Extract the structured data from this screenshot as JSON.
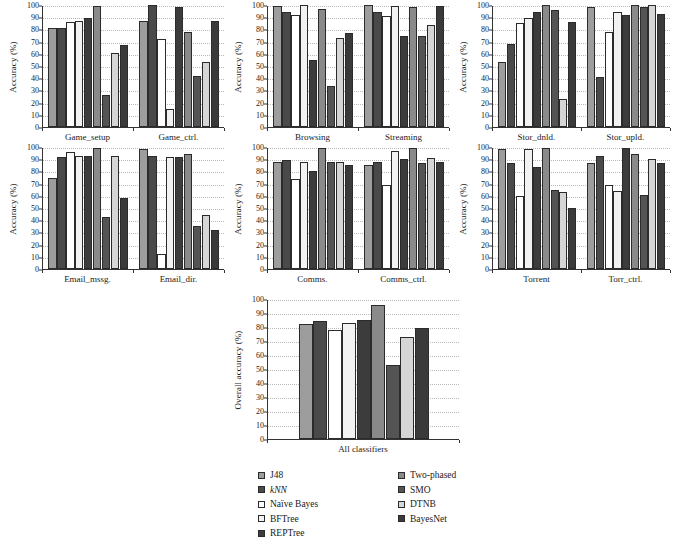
{
  "chart_data": [
    {
      "id": "games",
      "type": "bar",
      "title": "",
      "xlabel": "",
      "ylabel": "Accuracy (%)",
      "ylim": [
        0,
        100
      ],
      "yticks": [
        0,
        10,
        20,
        30,
        40,
        50,
        60,
        70,
        80,
        90,
        100
      ],
      "grid": true,
      "legend_position": "bottom-shared",
      "categories": [
        "Game_setup",
        "Game_ctrl."
      ],
      "series": [
        {
          "name": "J48",
          "values": [
            81,
            87
          ]
        },
        {
          "name": "kNN",
          "values": [
            81,
            100
          ]
        },
        {
          "name": "Naïve Bayes",
          "values": [
            86,
            72
          ]
        },
        {
          "name": "BFTree",
          "values": [
            87,
            15
          ]
        },
        {
          "name": "REPTree",
          "values": [
            89,
            98
          ]
        },
        {
          "name": "Two-phased",
          "values": [
            99,
            78
          ]
        },
        {
          "name": "SMO",
          "values": [
            26,
            42
          ]
        },
        {
          "name": "DTNB",
          "values": [
            61,
            53
          ]
        },
        {
          "name": "BayesNet",
          "values": [
            67,
            87
          ]
        }
      ]
    },
    {
      "id": "web",
      "type": "bar",
      "title": "",
      "xlabel": "",
      "ylabel": "Accuracy (%)",
      "ylim": [
        0,
        100
      ],
      "yticks": [
        0,
        10,
        20,
        30,
        40,
        50,
        60,
        70,
        80,
        90,
        100
      ],
      "grid": true,
      "categories": [
        "Browsing",
        "Streaming"
      ],
      "series": [
        {
          "name": "J48",
          "values": [
            99,
            100
          ]
        },
        {
          "name": "kNN",
          "values": [
            94,
            94
          ]
        },
        {
          "name": "Naïve Bayes",
          "values": [
            92,
            91
          ]
        },
        {
          "name": "BFTree",
          "values": [
            100,
            99
          ]
        },
        {
          "name": "REPTree",
          "values": [
            55,
            75
          ]
        },
        {
          "name": "Two-phased",
          "values": [
            97,
            98
          ]
        },
        {
          "name": "SMO",
          "values": [
            34,
            75
          ]
        },
        {
          "name": "DTNB",
          "values": [
            73,
            84
          ]
        },
        {
          "name": "BayesNet",
          "values": [
            77,
            99
          ]
        }
      ]
    },
    {
      "id": "storage",
      "type": "bar",
      "title": "",
      "xlabel": "",
      "ylabel": "Accuracy (%)",
      "ylim": [
        0,
        100
      ],
      "yticks": [
        0,
        10,
        20,
        30,
        40,
        50,
        60,
        70,
        80,
        90,
        100
      ],
      "grid": true,
      "categories": [
        "Stor_dnld.",
        "Stor_upld."
      ],
      "series": [
        {
          "name": "J48",
          "values": [
            53,
            98
          ]
        },
        {
          "name": "kNN",
          "values": [
            68,
            41
          ]
        },
        {
          "name": "Naïve Bayes",
          "values": [
            85,
            78
          ]
        },
        {
          "name": "BFTree",
          "values": [
            89,
            94
          ]
        },
        {
          "name": "REPTree",
          "values": [
            94,
            92
          ]
        },
        {
          "name": "Two-phased",
          "values": [
            100,
            100
          ]
        },
        {
          "name": "SMO",
          "values": [
            96,
            98
          ]
        },
        {
          "name": "DTNB",
          "values": [
            23,
            100
          ]
        },
        {
          "name": "BayesNet",
          "values": [
            86,
            93
          ]
        }
      ]
    },
    {
      "id": "email",
      "type": "bar",
      "title": "",
      "xlabel": "",
      "ylabel": "Accuracy (%)",
      "ylim": [
        0,
        100
      ],
      "yticks": [
        0,
        10,
        20,
        30,
        40,
        50,
        60,
        70,
        80,
        90,
        100
      ],
      "grid": true,
      "categories": [
        "Email_mssg.",
        "Email_dir."
      ],
      "series": [
        {
          "name": "J48",
          "values": [
            75,
            98
          ]
        },
        {
          "name": "kNN",
          "values": [
            92,
            93
          ]
        },
        {
          "name": "Naïve Bayes",
          "values": [
            96,
            12
          ]
        },
        {
          "name": "BFTree",
          "values": [
            93,
            92
          ]
        },
        {
          "name": "REPTree",
          "values": [
            93,
            92
          ]
        },
        {
          "name": "Two-phased",
          "values": [
            99,
            94
          ]
        },
        {
          "name": "SMO",
          "values": [
            43,
            35
          ]
        },
        {
          "name": "DTNB",
          "values": [
            93,
            44
          ]
        },
        {
          "name": "BayesNet",
          "values": [
            58,
            32
          ]
        }
      ]
    },
    {
      "id": "comms",
      "type": "bar",
      "title": "",
      "xlabel": "",
      "ylabel": "Accuracy (%)",
      "ylim": [
        0,
        100
      ],
      "yticks": [
        0,
        10,
        20,
        30,
        40,
        50,
        60,
        70,
        80,
        90,
        100
      ],
      "grid": true,
      "categories": [
        "Comms.",
        "Comms_ctrl."
      ],
      "series": [
        {
          "name": "J48",
          "values": [
            88,
            85
          ]
        },
        {
          "name": "kNN",
          "values": [
            89,
            88
          ]
        },
        {
          "name": "Naïve Bayes",
          "values": [
            74,
            69
          ]
        },
        {
          "name": "BFTree",
          "values": [
            88,
            97
          ]
        },
        {
          "name": "REPTree",
          "values": [
            80,
            90
          ]
        },
        {
          "name": "Two-phased",
          "values": [
            99,
            99
          ]
        },
        {
          "name": "SMO",
          "values": [
            88,
            87
          ]
        },
        {
          "name": "DTNB",
          "values": [
            88,
            91
          ]
        },
        {
          "name": "BayesNet",
          "values": [
            85,
            88
          ]
        }
      ]
    },
    {
      "id": "torrent",
      "type": "bar",
      "title": "",
      "xlabel": "",
      "ylabel": "Accuracy (%)",
      "ylim": [
        0,
        100
      ],
      "yticks": [
        0,
        10,
        20,
        30,
        40,
        50,
        60,
        70,
        80,
        90,
        100
      ],
      "grid": true,
      "categories": [
        "Torrent",
        "Torr_ctrl."
      ],
      "series": [
        {
          "name": "J48",
          "values": [
            98,
            87
          ]
        },
        {
          "name": "kNN",
          "values": [
            87,
            93
          ]
        },
        {
          "name": "Naïve Bayes",
          "values": [
            60,
            69
          ]
        },
        {
          "name": "BFTree",
          "values": [
            98,
            64
          ]
        },
        {
          "name": "REPTree",
          "values": [
            84,
            99
          ]
        },
        {
          "name": "Two-phased",
          "values": [
            99,
            94
          ]
        },
        {
          "name": "SMO",
          "values": [
            65,
            61
          ]
        },
        {
          "name": "DTNB",
          "values": [
            63,
            90
          ]
        },
        {
          "name": "BayesNet",
          "values": [
            50,
            87
          ]
        }
      ]
    },
    {
      "id": "overall",
      "type": "bar",
      "title": "",
      "xlabel": "",
      "ylabel": "Overall accuracy (%)",
      "ylim": [
        0,
        100
      ],
      "yticks": [
        0,
        10,
        20,
        30,
        40,
        50,
        60,
        70,
        80,
        90,
        100
      ],
      "grid": true,
      "categories": [
        "All classifiers"
      ],
      "series": [
        {
          "name": "J48",
          "values": [
            82
          ]
        },
        {
          "name": "kNN",
          "values": [
            84
          ]
        },
        {
          "name": "Naïve Bayes",
          "values": [
            78
          ]
        },
        {
          "name": "BFTree",
          "values": [
            83
          ]
        },
        {
          "name": "REPTree",
          "values": [
            85
          ]
        },
        {
          "name": "Two-phased",
          "values": [
            96
          ]
        },
        {
          "name": "SMO",
          "values": [
            53
          ]
        },
        {
          "name": "DTNB",
          "values": [
            73
          ]
        },
        {
          "name": "BayesNet",
          "values": [
            79
          ]
        }
      ]
    }
  ],
  "series_colors": [
    "#9d9d9d",
    "#4a4a4a",
    "#ffffff",
    "#f2f2f2",
    "#3c3c3c",
    "#8a8a8a",
    "#545454",
    "#d6d6d6",
    "#3a3a3a"
  ],
  "legend": {
    "column_left": [
      {
        "name": "J48",
        "italic": false
      },
      {
        "name": "kNN",
        "italic": true
      },
      {
        "name": "Naïve Bayes",
        "italic": false
      },
      {
        "name": "BFTree",
        "italic": false
      },
      {
        "name": "REPTree",
        "italic": false
      }
    ],
    "column_right": [
      {
        "name": "Two-phased",
        "italic": false
      },
      {
        "name": "SMO",
        "italic": false
      },
      {
        "name": "DTNB",
        "italic": false
      },
      {
        "name": "BayesNet",
        "italic": false
      }
    ]
  }
}
